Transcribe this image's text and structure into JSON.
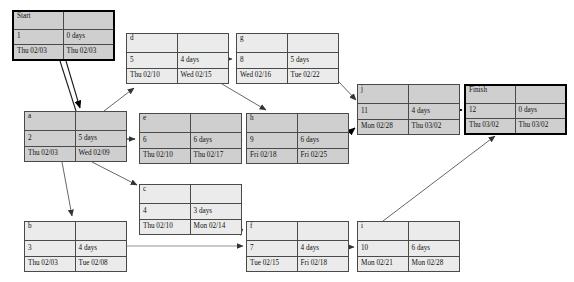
{
  "diagram": {
    "type": "pert-cpm-network"
  },
  "nodes": [
    {
      "key": "start",
      "name": "Start",
      "id": "1",
      "duration": "0 days",
      "start": "Thu 02/03",
      "finish": "Thu 02/03",
      "critical": true,
      "terminal": true,
      "x": 12,
      "y": 10,
      "w": 103,
      "h": 51
    },
    {
      "key": "d",
      "name": "d",
      "id": "5",
      "duration": "4 days",
      "start": "Thu 02/10",
      "finish": "Wed 02/15",
      "critical": false,
      "terminal": false,
      "x": 126,
      "y": 33,
      "w": 103,
      "h": 51
    },
    {
      "key": "g",
      "name": "g",
      "id": "8",
      "duration": "5 days",
      "start": "Wed 02/16",
      "finish": "Tue 02/22",
      "critical": false,
      "terminal": false,
      "x": 236,
      "y": 33,
      "w": 103,
      "h": 51
    },
    {
      "key": "j",
      "name": "j",
      "id": "11",
      "duration": "4 days",
      "start": "Mon 02/28",
      "finish": "Thu 03/02",
      "critical": true,
      "terminal": false,
      "x": 357,
      "y": 84,
      "w": 103,
      "h": 51
    },
    {
      "key": "finish",
      "name": "Finish",
      "id": "12",
      "duration": "0 days",
      "start": "Thu 03/02",
      "finish": "Thu 03/02",
      "critical": true,
      "terminal": true,
      "x": 464,
      "y": 84,
      "w": 103,
      "h": 51
    },
    {
      "key": "a",
      "name": "a",
      "id": "2",
      "duration": "5 days",
      "start": "Thu 02/03",
      "finish": "Wed 02/09",
      "critical": true,
      "terminal": false,
      "x": 24,
      "y": 111,
      "w": 103,
      "h": 51
    },
    {
      "key": "e",
      "name": "e",
      "id": "6",
      "duration": "6 days",
      "start": "Thu 02/10",
      "finish": "Thu 02/17",
      "critical": true,
      "terminal": false,
      "x": 139,
      "y": 113,
      "w": 103,
      "h": 51
    },
    {
      "key": "h",
      "name": "h",
      "id": "9",
      "duration": "6 days",
      "start": "Fri 02/18",
      "finish": "Fri 02/25",
      "critical": true,
      "terminal": false,
      "x": 246,
      "y": 113,
      "w": 103,
      "h": 51
    },
    {
      "key": "c",
      "name": "c",
      "id": "4",
      "duration": "3 days",
      "start": "Thu 02/10",
      "finish": "Mon 02/14",
      "critical": false,
      "terminal": false,
      "x": 139,
      "y": 184,
      "w": 103,
      "h": 51
    },
    {
      "key": "b",
      "name": "b",
      "id": "3",
      "duration": "4 days",
      "start": "Thu 02/03",
      "finish": "Tue 02/08",
      "critical": false,
      "terminal": false,
      "x": 24,
      "y": 221,
      "w": 103,
      "h": 51
    },
    {
      "key": "f",
      "name": "f",
      "id": "7",
      "duration": "4 days",
      "start": "Tue 02/15",
      "finish": "Fri 02/18",
      "critical": false,
      "terminal": false,
      "x": 246,
      "y": 221,
      "w": 103,
      "h": 51
    },
    {
      "key": "i",
      "name": "i",
      "id": "10",
      "duration": "6 days",
      "start": "Mon 02/21",
      "finish": "Mon 02/28",
      "critical": false,
      "terminal": false,
      "x": 357,
      "y": 221,
      "w": 103,
      "h": 51
    }
  ],
  "edges": [
    {
      "from": "start",
      "to": "a",
      "label": ""
    },
    {
      "from": "start",
      "to": "a2",
      "label": ""
    },
    {
      "from": "a",
      "to": "d",
      "label": ""
    },
    {
      "from": "a",
      "to": "e",
      "label": ""
    },
    {
      "from": "a",
      "to": "c",
      "label": ""
    },
    {
      "from": "a",
      "to": "b",
      "label": ""
    },
    {
      "from": "d",
      "to": "g",
      "label": ""
    },
    {
      "from": "d",
      "to": "h",
      "label": ""
    },
    {
      "from": "g",
      "to": "j",
      "label": ""
    },
    {
      "from": "e",
      "to": "h",
      "label": ""
    },
    {
      "from": "h",
      "to": "j",
      "label": ""
    },
    {
      "from": "c",
      "to": "f",
      "label": ""
    },
    {
      "from": "b",
      "to": "f",
      "label": ""
    },
    {
      "from": "f",
      "to": "i",
      "label": ""
    },
    {
      "from": "i",
      "to": "finish",
      "label": ""
    },
    {
      "from": "j",
      "to": "finish",
      "label": ""
    }
  ],
  "colors": {
    "critical_fill": "#cfcfcf",
    "normal_fill": "#ebebeb",
    "border": "#4a4a4a",
    "terminal_border": "#000000",
    "edge": "#555555",
    "background": "#ffffff"
  }
}
